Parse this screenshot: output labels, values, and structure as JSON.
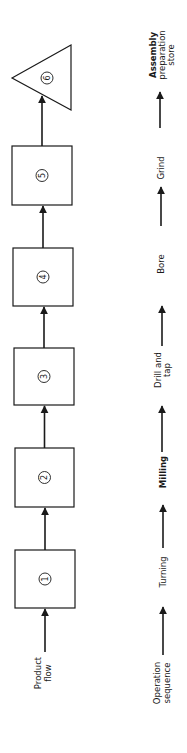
{
  "diagram": {
    "type": "process-flow",
    "orientation": "rotated-90-ccw",
    "stroke_color": "#1a1a1a",
    "background": "#ffffff",
    "product_flow": {
      "label_lines": [
        "Product",
        "flow"
      ],
      "steps": [
        {
          "id": 1,
          "shape": "square",
          "label": "1"
        },
        {
          "id": 2,
          "shape": "square",
          "label": "2"
        },
        {
          "id": 3,
          "shape": "square",
          "label": "3"
        },
        {
          "id": 4,
          "shape": "square",
          "label": "4"
        },
        {
          "id": 5,
          "shape": "square",
          "label": "5"
        },
        {
          "id": 6,
          "shape": "triangle",
          "label": "6"
        }
      ]
    },
    "operation_sequence": {
      "label_lines": [
        "Operation",
        "sequence"
      ],
      "operations": [
        {
          "lines": [
            "Turning"
          ]
        },
        {
          "lines": [
            "Milling"
          ]
        },
        {
          "lines": [
            "Drill and",
            "tap"
          ]
        },
        {
          "lines": [
            "Bore"
          ]
        },
        {
          "lines": [
            "Grind"
          ]
        },
        {
          "lines": [
            "Assembly",
            "preparation",
            "store"
          ]
        }
      ]
    }
  }
}
